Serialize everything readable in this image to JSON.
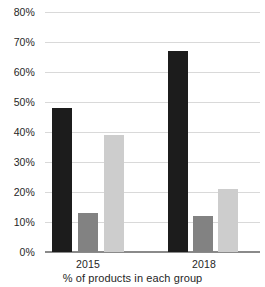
{
  "chart_data": {
    "type": "bar",
    "title": "",
    "subtitle": "",
    "xlabel": "% of products in each group",
    "ylabel": "",
    "categories": [
      "2015",
      "2018"
    ],
    "series": [
      {
        "name": "series-1-dark",
        "color": "#1c1c1c",
        "values": [
          48,
          67
        ]
      },
      {
        "name": "series-2-mid",
        "color": "#828282",
        "values": [
          13,
          12
        ]
      },
      {
        "name": "series-3-light",
        "color": "#cdcdcd",
        "values": [
          39,
          21
        ]
      }
    ],
    "ylim": [
      0,
      80
    ],
    "ytick_values": [
      0,
      10,
      20,
      30,
      40,
      50,
      60,
      70,
      80
    ],
    "ytick_labels": [
      "0%",
      "10%",
      "20%",
      "30%",
      "40%",
      "50%",
      "60%",
      "70%",
      "80%"
    ],
    "grid": true,
    "legend": "none",
    "orientation": "vertical",
    "grouped": true
  },
  "axis": {
    "y_ticks": [
      {
        "label": "80%",
        "value": 80
      },
      {
        "label": "70%",
        "value": 70
      },
      {
        "label": "60%",
        "value": 60
      },
      {
        "label": "50%",
        "value": 50
      },
      {
        "label": "40%",
        "value": 40
      },
      {
        "label": "30%",
        "value": 30
      },
      {
        "label": "20%",
        "value": 20
      },
      {
        "label": "10%",
        "value": 10
      },
      {
        "label": "0%",
        "value": 0
      }
    ],
    "x_groups": [
      {
        "label": "2015"
      },
      {
        "label": "2018"
      }
    ]
  },
  "caption": {
    "text": "% of products in each group"
  },
  "colors": {
    "dark": "#1c1c1c",
    "mid": "#828282",
    "light": "#cdcdcd",
    "gridline": "#d9d9d9",
    "axis": "#8a8a8a",
    "text": "#262626",
    "background": "#ffffff"
  }
}
